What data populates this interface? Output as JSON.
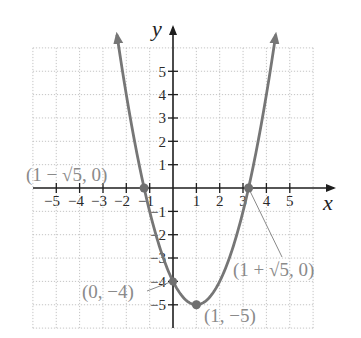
{
  "chart_data": {
    "type": "line",
    "title": "",
    "function": "y = x^2 - 2x - 4",
    "xlabel": "x",
    "ylabel": "y",
    "xlim": [
      -6,
      6
    ],
    "ylim": [
      -6,
      6
    ],
    "grid": true,
    "x_ticks": [
      -5,
      -4,
      -3,
      -2,
      -1,
      1,
      2,
      3,
      4,
      5
    ],
    "y_ticks": [
      -5,
      -4,
      -3,
      -2,
      -1,
      1,
      2,
      3,
      4,
      5
    ],
    "x_tick_labels": [
      "−5",
      "−4",
      "−3",
      "−2",
      "−1",
      "1",
      "2",
      "3",
      "4",
      "5"
    ],
    "y_tick_labels": [
      "−5",
      "−4",
      "−3",
      "−2",
      "−1",
      "1",
      "2",
      "3",
      "4",
      "5"
    ],
    "series": [
      {
        "name": "parabola",
        "x": [
          -2.4,
          -2,
          -1.5,
          -1,
          -0.5,
          0,
          0.5,
          1,
          1.5,
          2,
          2.5,
          3,
          3.5,
          4,
          4.4
        ],
        "values": [
          6.56,
          4,
          1.25,
          -1,
          -2.75,
          -4,
          -4.75,
          -5,
          -4.75,
          -4,
          -2.75,
          -1,
          1.25,
          4,
          6.56
        ]
      }
    ],
    "points": [
      {
        "x": -1.236,
        "y": 0,
        "label": "(1 − √5, 0)"
      },
      {
        "x": 3.236,
        "y": 0,
        "label": "(1 + √5, 0)"
      },
      {
        "x": 0,
        "y": -4,
        "label": "(0, −4)"
      },
      {
        "x": 1,
        "y": -5,
        "label": "(1, −5)"
      }
    ],
    "annotations": [
      "(1 − √5, 0)",
      "(1 + √5, 0)",
      "(0, −4)",
      "(1, −5)"
    ]
  },
  "labels": {
    "x_axis": "x",
    "y_axis": "y",
    "pt_left_root": "(1 − √5, 0)",
    "pt_right_root": "(1 + √5, 0)",
    "pt_y_intercept": "(0, −4)",
    "pt_vertex": "(1, −5)",
    "xt": [
      "−5",
      "−4",
      "−3",
      "−2",
      "−1",
      "1",
      "2",
      "3",
      "4",
      "5"
    ],
    "yt": [
      "5",
      "4",
      "3",
      "2",
      "1",
      "−1",
      "−2",
      "−3",
      "−4",
      "−5"
    ]
  }
}
